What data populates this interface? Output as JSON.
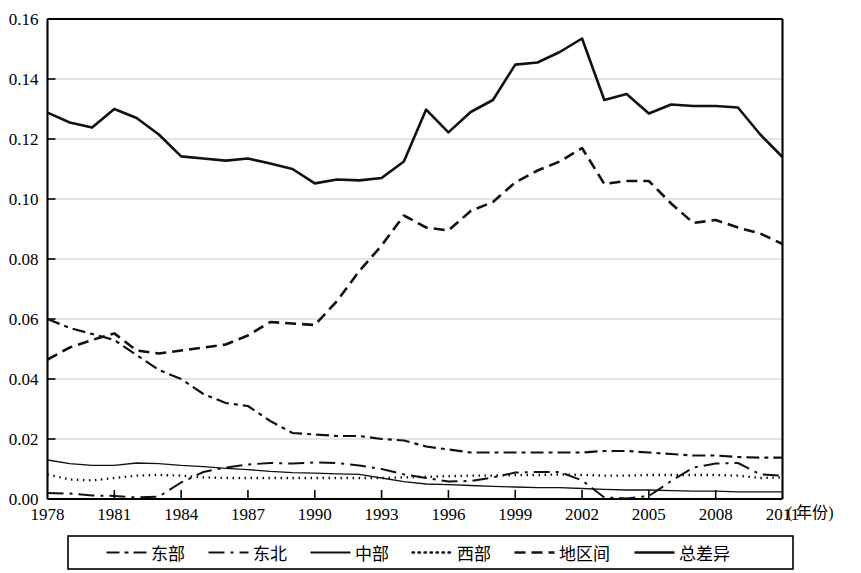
{
  "chart_data": {
    "type": "line",
    "title": "",
    "xlabel": "年份",
    "ylabel": "",
    "xlim": [
      1978,
      2011
    ],
    "ylim": [
      0.0,
      0.16
    ],
    "grid": true,
    "legend_position": "bottom",
    "x_unit_annotation": "( 年份)",
    "y_ticks": [
      "0.00",
      "0.02",
      "0.04",
      "0.06",
      "0.08",
      "0.10",
      "0.12",
      "0.14",
      "0.16"
    ],
    "y_tick_values": [
      0.0,
      0.02,
      0.04,
      0.06,
      0.08,
      0.1,
      0.12,
      0.14,
      0.16
    ],
    "x_ticks": [
      "1978",
      "1981",
      "1984",
      "1987",
      "1990",
      "1993",
      "1996",
      "1999",
      "2002",
      "2005",
      "2008",
      "2011"
    ],
    "x_tick_values": [
      1978,
      1981,
      1984,
      1987,
      1990,
      1993,
      1996,
      1999,
      2002,
      2005,
      2008,
      2011
    ],
    "x": [
      1978,
      1979,
      1980,
      1981,
      1982,
      1983,
      1984,
      1985,
      1986,
      1987,
      1988,
      1989,
      1990,
      1991,
      1992,
      1993,
      1994,
      1995,
      1996,
      1997,
      1998,
      1999,
      2000,
      2001,
      2002,
      2003,
      2004,
      2005,
      2006,
      2007,
      2008,
      2009,
      2010,
      2011
    ],
    "series": [
      {
        "name": "东部",
        "style": "dash-dot",
        "width": 2.2,
        "color": "#111111",
        "values": [
          0.06,
          0.057,
          0.055,
          0.053,
          0.048,
          0.043,
          0.04,
          0.035,
          0.032,
          0.031,
          0.026,
          0.022,
          0.0215,
          0.021,
          0.021,
          0.02,
          0.0195,
          0.0175,
          0.0165,
          0.0155,
          0.0155,
          0.0155,
          0.0155,
          0.0155,
          0.0155,
          0.016,
          0.016,
          0.0155,
          0.015,
          0.0145,
          0.0145,
          0.014,
          0.0138,
          0.0138
        ]
      },
      {
        "name": "东北",
        "style": "long-dash-dot",
        "width": 2.0,
        "color": "#111111",
        "values": [
          0.002,
          0.0018,
          0.0012,
          0.001,
          0.0005,
          0.0008,
          0.0055,
          0.009,
          0.0105,
          0.0115,
          0.012,
          0.0118,
          0.0122,
          0.012,
          0.0112,
          0.01,
          0.0082,
          0.007,
          0.0058,
          0.006,
          0.0072,
          0.0088,
          0.009,
          0.009,
          0.0062,
          0.0005,
          0.0002,
          0.001,
          0.006,
          0.0105,
          0.0118,
          0.012,
          0.0082,
          0.0078
        ]
      },
      {
        "name": "中部",
        "style": "solid-thin",
        "width": 1.3,
        "color": "#111111",
        "values": [
          0.013,
          0.0118,
          0.0112,
          0.0112,
          0.012,
          0.0118,
          0.0112,
          0.0108,
          0.0102,
          0.0098,
          0.0092,
          0.0088,
          0.0086,
          0.0084,
          0.0082,
          0.007,
          0.0058,
          0.005,
          0.0048,
          0.0045,
          0.0042,
          0.004,
          0.0038,
          0.0038,
          0.0035,
          0.0032,
          0.003,
          0.003,
          0.0028,
          0.0026,
          0.0026,
          0.0024,
          0.0024,
          0.0024
        ]
      },
      {
        "name": "西部",
        "style": "dotted",
        "width": 2.4,
        "color": "#111111",
        "values": [
          0.0082,
          0.0065,
          0.0062,
          0.007,
          0.0078,
          0.008,
          0.0078,
          0.0072,
          0.007,
          0.007,
          0.007,
          0.007,
          0.007,
          0.007,
          0.007,
          0.007,
          0.0072,
          0.0074,
          0.0076,
          0.0078,
          0.0078,
          0.008,
          0.008,
          0.0082,
          0.008,
          0.0078,
          0.0078,
          0.008,
          0.008,
          0.008,
          0.008,
          0.0078,
          0.007,
          0.0072
        ]
      },
      {
        "name": "地区间",
        "style": "dashed",
        "width": 2.6,
        "color": "#111111",
        "values": [
          0.0465,
          0.0505,
          0.053,
          0.0552,
          0.0495,
          0.0485,
          0.0495,
          0.0505,
          0.0515,
          0.0545,
          0.059,
          0.0585,
          0.058,
          0.066,
          0.076,
          0.0845,
          0.0945,
          0.0905,
          0.0895,
          0.096,
          0.099,
          0.1055,
          0.1095,
          0.1125,
          0.117,
          0.105,
          0.106,
          0.106,
          0.0985,
          0.092,
          0.093,
          0.0905,
          0.0885,
          0.085
        ]
      },
      {
        "name": "总差异",
        "style": "solid-thick",
        "width": 2.6,
        "color": "#111111",
        "values": [
          0.1288,
          0.1255,
          0.1238,
          0.13,
          0.127,
          0.1215,
          0.1142,
          0.1135,
          0.1128,
          0.1135,
          0.1118,
          0.11,
          0.1052,
          0.1065,
          0.1062,
          0.107,
          0.1125,
          0.1298,
          0.1222,
          0.129,
          0.133,
          0.1448,
          0.1455,
          0.149,
          0.1535,
          0.133,
          0.135,
          0.1285,
          0.1315,
          0.131,
          0.131,
          0.1305,
          0.1215,
          0.114
        ]
      }
    ],
    "legend": [
      {
        "label": "东部",
        "style": "dash-dot"
      },
      {
        "label": "东北",
        "style": "long-dash-dot"
      },
      {
        "label": "中部",
        "style": "solid-thin"
      },
      {
        "label": "西部",
        "style": "dotted"
      },
      {
        "label": "地区间",
        "style": "dashed"
      },
      {
        "label": "总差异",
        "style": "solid-thick"
      }
    ]
  }
}
